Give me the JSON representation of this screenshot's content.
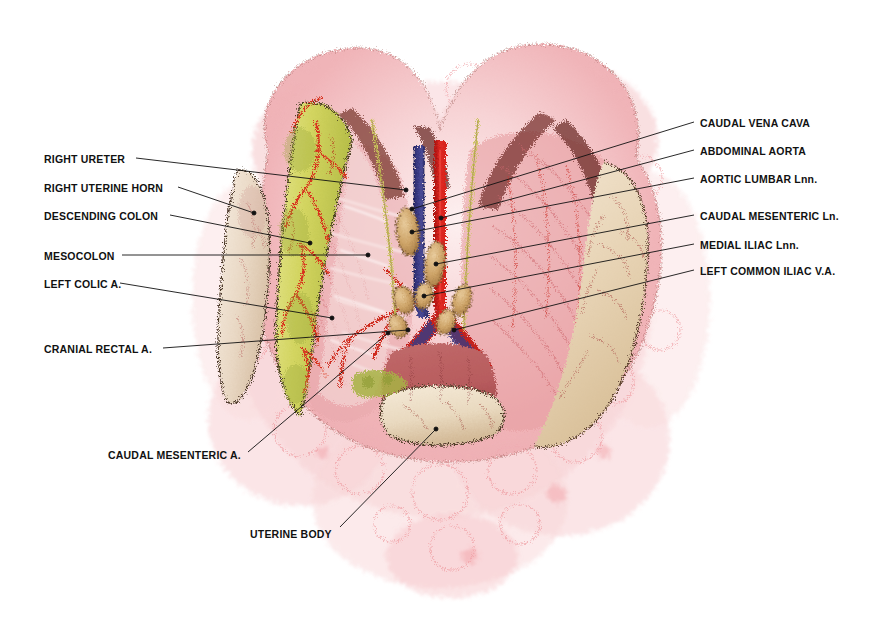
{
  "figure": {
    "background_color": "#ffffff",
    "label_color": "#111111"
  },
  "palette": {
    "tissue_pink": "#f2b8bc",
    "tissue_pink_light": "#f8dcdd",
    "tissue_pink_pale": "#fbeced",
    "colon_yellow": "#d9d96a",
    "colon_olive": "#b8c049",
    "peritoneum_cream": "#eddcc2",
    "peritoneum_tan": "#e0c9a6",
    "artery_red": "#d8221e",
    "vein_blue": "#3a3a86",
    "lymph_node_tan": "#cfa568",
    "vessel_outline": "#6e2b1c",
    "ink_outline": "#3a2a20"
  },
  "labels_left": [
    {
      "id": "right-ureter",
      "text": "RIGHT URETER",
      "x": 44,
      "y": 154,
      "lx": 136,
      "ly": 158,
      "tx": 406,
      "ty": 190
    },
    {
      "id": "right-uterine-horn",
      "text": "RIGHT UTERINE HORN",
      "x": 44,
      "y": 183,
      "lx": 178,
      "ly": 187,
      "tx": 254,
      "ty": 213
    },
    {
      "id": "descending-colon",
      "text": "DESCENDING COLON",
      "x": 44,
      "y": 211,
      "lx": 170,
      "ly": 215,
      "tx": 310,
      "ty": 243
    },
    {
      "id": "mesocolon",
      "text": "MESOCOLON",
      "x": 44,
      "y": 251,
      "lx": 122,
      "ly": 255,
      "tx": 368,
      "ty": 255
    },
    {
      "id": "left-colic-a",
      "text": "LEFT COLIC A.",
      "x": 44,
      "y": 279,
      "lx": 120,
      "ly": 283,
      "tx": 332,
      "ty": 318
    },
    {
      "id": "cranial-rectal-a",
      "text": "CRANIAL RECTAL A.",
      "x": 44,
      "y": 344,
      "lx": 163,
      "ly": 348,
      "tx": 408,
      "ty": 330
    },
    {
      "id": "caudal-mesenteric-a",
      "text": "CAUDAL MESENTERIC A.",
      "x": 108,
      "y": 450,
      "lx": 248,
      "ly": 452,
      "tx": 388,
      "ty": 333
    },
    {
      "id": "uterine-body",
      "text": "UTERINE BODY",
      "x": 250,
      "y": 529,
      "lx": 340,
      "ly": 527,
      "tx": 436,
      "ty": 429
    }
  ],
  "labels_right": [
    {
      "id": "caudal-vena-cava",
      "text": "CAUDAL VENA CAVA",
      "x": 700,
      "y": 118,
      "lx": 694,
      "ly": 122,
      "tx": 412,
      "ty": 209
    },
    {
      "id": "abdominal-aorta",
      "text": "ABDOMINAL AORTA",
      "x": 700,
      "y": 146,
      "lx": 694,
      "ly": 150,
      "tx": 441,
      "ty": 218
    },
    {
      "id": "aortic-lumbar-lnn",
      "text": "AORTIC LUMBAR Lnn.",
      "x": 700,
      "y": 174,
      "lx": 694,
      "ly": 178,
      "tx": 412,
      "ty": 232
    },
    {
      "id": "caudal-mesenteric-ln",
      "text": "CAUDAL MESENTERIC Ln.",
      "x": 700,
      "y": 211,
      "lx": 694,
      "ly": 215,
      "tx": 436,
      "ty": 264
    },
    {
      "id": "medial-iliac-lnn",
      "text": "MEDIAL ILIAC Lnn.",
      "x": 700,
      "y": 240,
      "lx": 694,
      "ly": 244,
      "tx": 424,
      "ty": 296
    },
    {
      "id": "left-common-iliac-va",
      "text": "LEFT COMMON ILIAC V.A.",
      "x": 700,
      "y": 266,
      "lx": 694,
      "ly": 270,
      "tx": 454,
      "ty": 330
    }
  ],
  "structures": [
    {
      "id": "peritoneal-mass",
      "name": "pink peritoneal / fatty tissue mass"
    },
    {
      "id": "descending-colon",
      "name": "descending colon (yellow-olive band)"
    },
    {
      "id": "mesocolon",
      "name": "mesocolon sheet"
    },
    {
      "id": "abdominal-aorta",
      "name": "abdominal aorta (red vessel)"
    },
    {
      "id": "caudal-vena-cava",
      "name": "caudal vena cava (blue vessel)"
    },
    {
      "id": "uterine-horn",
      "name": "right uterine horn"
    },
    {
      "id": "uterine-body",
      "name": "uterine body"
    },
    {
      "id": "lymph-nodes",
      "name": "aortic lumbar, caudal mesenteric and medial iliac lymph nodes"
    }
  ]
}
